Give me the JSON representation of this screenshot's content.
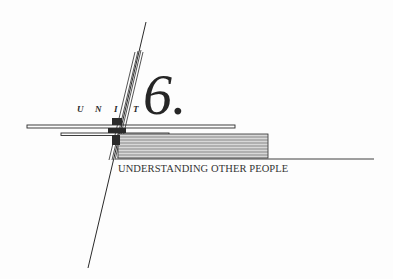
{
  "heading": {
    "unit_letters": [
      "U",
      "N",
      "I",
      "T"
    ],
    "unit_number": "6.",
    "title": "UNDERSTANDING OTHER PEOPLE"
  },
  "colors": {
    "ink": "#2a2a2a",
    "paper": "#fdfdfd",
    "shade": "#c8c8c8"
  }
}
